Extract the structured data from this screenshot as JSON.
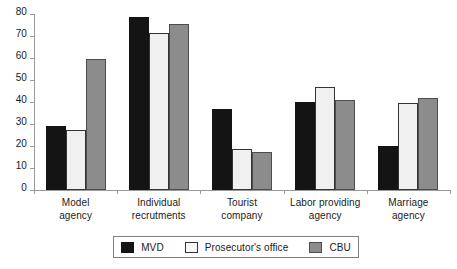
{
  "chart_data": {
    "type": "bar",
    "title": "",
    "subtitle": "",
    "xlabel": "",
    "ylabel": "",
    "ylim": [
      0,
      80
    ],
    "ytick_step": 10,
    "yticks": [
      "80",
      "70",
      "60",
      "50",
      "40",
      "30",
      "20",
      "10",
      "0"
    ],
    "grid": false,
    "legend_position": "bottom",
    "categories": [
      "Model\nagency",
      "Individual\nrecrutments",
      "Tourist\ncompany",
      "Labor providing\nagency",
      "Marriage\nagency"
    ],
    "category_labels": [
      {
        "line1": "Model",
        "line2": "agency"
      },
      {
        "line1": "Individual",
        "line2": "recrutments"
      },
      {
        "line1": "Tourist",
        "line2": "company"
      },
      {
        "line1": "Labor providing",
        "line2": "agency"
      },
      {
        "line1": "Marriage",
        "line2": "agency"
      }
    ],
    "series": [
      {
        "name": "MVD",
        "color": "#141414",
        "values": [
          29,
          78.5,
          37,
          40,
          20
        ]
      },
      {
        "name": "Prosecutor's office",
        "color": "#f0f0f0",
        "values": [
          27.5,
          71.5,
          18.5,
          47,
          39.5
        ]
      },
      {
        "name": "CBU",
        "color": "#8c8c8c",
        "values": [
          59.5,
          75.5,
          17.5,
          41,
          42
        ]
      }
    ]
  },
  "legend": {
    "items": [
      {
        "label": "MVD",
        "swatch": "black-swatch"
      },
      {
        "label": "Prosecutor's office",
        "swatch": "white-swatch"
      },
      {
        "label": "CBU",
        "swatch": "gray-swatch"
      }
    ]
  },
  "colors": {
    "series_mvd": "#141414",
    "series_prosecutor": "#f0f0f0",
    "series_cbu": "#8c8c8c",
    "axis": "#9a9a9a",
    "text": "#1a1a1a",
    "background": "#ffffff"
  }
}
